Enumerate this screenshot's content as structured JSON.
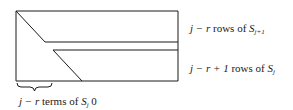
{
  "diagram": {
    "type": "matrix-block-structure",
    "colors": {
      "stroke": "#1a1a1a",
      "background": "#ffffff"
    },
    "labels": {
      "upper_block": {
        "prefix": "j − r",
        "text": " rows of ",
        "symbol": "S",
        "subscript": "j+1"
      },
      "lower_block": {
        "prefix": "j − r + 1",
        "text": " rows of ",
        "symbol": "S",
        "subscript": "j"
      },
      "brace": {
        "prefix": "j − r",
        "text": " terms of ",
        "symbol": "S",
        "subscript": "j",
        "suffix": " 0"
      }
    }
  }
}
